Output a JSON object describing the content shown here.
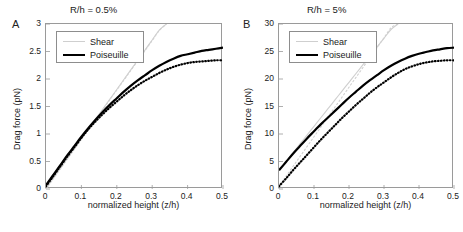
{
  "figure": {
    "xlabel": "normalized height (z/h)",
    "ylabel": "Drag force (pN)",
    "legend": {
      "shear": "Shear",
      "poiseuille": "Poiseuille"
    },
    "colors": {
      "shear": "#cfcfcf",
      "poiseuille": "#000000",
      "axis": "#9a9a9a"
    }
  },
  "panels": [
    {
      "letter": "A",
      "title": "R/h = 0.5%",
      "xticks": [
        "0",
        "0.1",
        "0.2",
        "0.3",
        "0.4",
        "0.5"
      ],
      "yticks": [
        "0",
        "0.5",
        "1",
        "1.5",
        "2",
        "2.5",
        "3"
      ]
    },
    {
      "letter": "B",
      "title": "R/h = 5%",
      "xticks": [
        "0",
        "0.1",
        "0.2",
        "0.3",
        "0.4",
        "0.5"
      ],
      "yticks": [
        "0",
        "5",
        "10",
        "15",
        "20",
        "25",
        "30"
      ]
    }
  ],
  "chart_data": [
    {
      "type": "line",
      "title": "R/h = 0.5%",
      "panel": "A",
      "xlabel": "normalized height (z/h)",
      "ylabel": "Drag force (pN)",
      "xlim": [
        0,
        0.5
      ],
      "ylim": [
        0,
        3
      ],
      "grid": false,
      "legend_position": "upper-left",
      "x": [
        0.0,
        0.02,
        0.04,
        0.06,
        0.08,
        0.1,
        0.12,
        0.14,
        0.16,
        0.18,
        0.2,
        0.22,
        0.24,
        0.26,
        0.28,
        0.3,
        0.32,
        0.34,
        0.36,
        0.38,
        0.4,
        0.42,
        0.44,
        0.46,
        0.48,
        0.5
      ],
      "series": [
        {
          "name": "Shear",
          "style": "solid",
          "color": "#cfcfcf",
          "values": [
            0.0,
            0.19,
            0.37,
            0.55,
            0.73,
            0.91,
            1.09,
            1.27,
            1.45,
            1.63,
            1.81,
            1.99,
            2.17,
            2.35,
            2.53,
            2.71,
            2.89,
            3.0,
            null,
            null,
            null,
            null,
            null,
            null,
            null,
            null
          ]
        },
        {
          "name": "Shear (dotted)",
          "style": "dotted",
          "color": "#cfcfcf",
          "values": [
            0.0,
            0.18,
            0.36,
            0.54,
            0.72,
            0.9,
            1.08,
            1.26,
            1.44,
            1.62,
            1.8,
            1.98,
            2.16,
            2.34,
            2.52,
            2.7,
            2.88,
            3.0,
            null,
            null,
            null,
            null,
            null,
            null,
            null,
            null
          ]
        },
        {
          "name": "Poiseuille",
          "style": "solid",
          "color": "#000000",
          "values": [
            0.07,
            0.25,
            0.43,
            0.61,
            0.78,
            0.95,
            1.11,
            1.26,
            1.4,
            1.53,
            1.65,
            1.77,
            1.88,
            1.98,
            2.07,
            2.16,
            2.24,
            2.31,
            2.37,
            2.42,
            2.45,
            2.48,
            2.51,
            2.53,
            2.55,
            2.57
          ]
        },
        {
          "name": "Poiseuille (dotted)",
          "style": "dotted",
          "color": "#000000",
          "values": [
            0.05,
            0.23,
            0.41,
            0.59,
            0.76,
            0.93,
            1.09,
            1.23,
            1.36,
            1.48,
            1.59,
            1.7,
            1.8,
            1.89,
            1.97,
            2.04,
            2.11,
            2.17,
            2.22,
            2.26,
            2.29,
            2.31,
            2.32,
            2.33,
            2.34,
            2.34
          ]
        }
      ]
    },
    {
      "type": "line",
      "title": "R/h = 5%",
      "panel": "B",
      "xlabel": "normalized height (z/h)",
      "ylabel": "Drag force (pN)",
      "xlim": [
        0,
        0.5
      ],
      "ylim": [
        0,
        30
      ],
      "grid": false,
      "legend_position": "upper-left",
      "x": [
        0.0,
        0.02,
        0.04,
        0.06,
        0.08,
        0.1,
        0.12,
        0.14,
        0.16,
        0.18,
        0.2,
        0.22,
        0.24,
        0.26,
        0.28,
        0.3,
        0.32,
        0.34,
        0.36,
        0.38,
        0.4,
        0.42,
        0.44,
        0.46,
        0.48,
        0.5
      ],
      "series": [
        {
          "name": "Shear",
          "style": "solid",
          "color": "#cfcfcf",
          "values": [
            3.4,
            5.0,
            6.6,
            8.2,
            9.8,
            11.4,
            13.0,
            14.6,
            16.2,
            17.8,
            19.4,
            21.0,
            22.6,
            24.2,
            25.8,
            27.4,
            29.0,
            30.0,
            null,
            null,
            null,
            null,
            null,
            null,
            null,
            null
          ]
        },
        {
          "name": "Shear (dotted)",
          "style": "dotted",
          "color": "#cfcfcf",
          "values": [
            0.5,
            2.3,
            4.1,
            5.9,
            7.7,
            9.5,
            11.3,
            13.1,
            14.9,
            16.7,
            18.5,
            20.3,
            22.1,
            23.9,
            25.7,
            27.5,
            29.3,
            30.0,
            null,
            null,
            null,
            null,
            null,
            null,
            null,
            null
          ]
        },
        {
          "name": "Poiseuille",
          "style": "solid",
          "color": "#000000",
          "values": [
            3.4,
            4.9,
            6.4,
            7.8,
            9.2,
            10.5,
            11.8,
            13.0,
            14.2,
            15.4,
            16.6,
            17.7,
            18.8,
            19.8,
            20.7,
            21.6,
            22.4,
            23.1,
            23.7,
            24.2,
            24.6,
            24.9,
            25.2,
            25.4,
            25.6,
            25.7
          ]
        },
        {
          "name": "Poiseuille (dotted)",
          "style": "dotted",
          "color": "#000000",
          "values": [
            0.5,
            1.9,
            3.4,
            4.8,
            6.2,
            7.6,
            9.0,
            10.3,
            11.6,
            12.9,
            14.1,
            15.3,
            16.4,
            17.5,
            18.5,
            19.4,
            20.3,
            21.1,
            21.8,
            22.3,
            22.7,
            23.0,
            23.2,
            23.3,
            23.4,
            23.4
          ]
        }
      ]
    }
  ]
}
